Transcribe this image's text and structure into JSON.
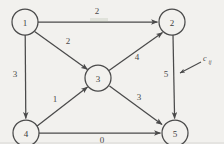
{
  "figure": {
    "type": "directed-network-diagram",
    "background_color": "#f2f1ee",
    "line_color": "#4a4a4a",
    "width": 224,
    "height": 144
  },
  "nodes": [
    {
      "id": "1",
      "label": "1",
      "cx": 25,
      "cy": 22,
      "r": 13
    },
    {
      "id": "2",
      "label": "2",
      "cx": 172,
      "cy": 22,
      "r": 13
    },
    {
      "id": "3",
      "label": "3",
      "cx": 98,
      "cy": 78,
      "r": 13
    },
    {
      "id": "4",
      "label": "4",
      "cx": 26,
      "cy": 133,
      "r": 13
    },
    {
      "id": "5",
      "label": "5",
      "cx": 175,
      "cy": 133,
      "r": 13
    }
  ],
  "edges": [
    {
      "id": "e12",
      "from": "1",
      "to": "2",
      "weight": "2",
      "label_x": 97,
      "label_y": 11
    },
    {
      "id": "e13",
      "from": "1",
      "to": "3",
      "weight": "2",
      "label_x": 68,
      "label_y": 41
    },
    {
      "id": "e14",
      "from": "1",
      "to": "4",
      "weight": "3",
      "label_x": 15,
      "label_y": 74
    },
    {
      "id": "e32",
      "from": "3",
      "to": "2",
      "weight": "4",
      "label_x": 137,
      "label_y": 57
    },
    {
      "id": "e43",
      "from": "4",
      "to": "3",
      "weight": "1",
      "label_x": 55,
      "label_y": 99
    },
    {
      "id": "e35",
      "from": "3",
      "to": "5",
      "weight": "3",
      "label_x": 139,
      "label_y": 97
    },
    {
      "id": "e25",
      "from": "2",
      "to": "5",
      "weight": "5",
      "label_x": 166,
      "label_y": 74
    },
    {
      "id": "e45",
      "from": "4",
      "to": "5",
      "weight": "0",
      "label_x": 102,
      "label_y": 140
    }
  ],
  "annotation": {
    "id": "cij-callout",
    "main_text": "c",
    "sub_text": "ij",
    "main_x": 203,
    "main_y": 58,
    "sub_x": 208,
    "sub_y": 61,
    "arrow_from_x": 201,
    "arrow_from_y": 62,
    "arrow_to_x": 180,
    "arrow_to_y": 73,
    "description": "cost label callout pointing at edge weight"
  }
}
